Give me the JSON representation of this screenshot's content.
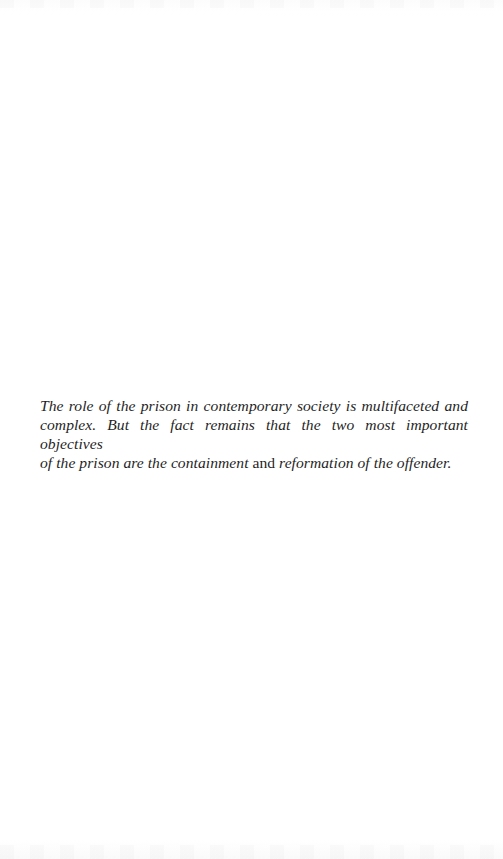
{
  "document": {
    "type": "book-page-epigraph",
    "epigraph": {
      "lines": [
        {
          "segments": [
            {
              "text": "The role of the prison in contemporary society is multifaceted and",
              "style": "italic"
            }
          ]
        },
        {
          "segments": [
            {
              "text": "complex. But the fact remains that the two most important objectives",
              "style": "italic"
            }
          ]
        },
        {
          "segments": [
            {
              "text": "of the prison are the containment",
              "style": "italic"
            },
            {
              "text": " and ",
              "style": "roman"
            },
            {
              "text": "reformation of the offender.",
              "style": "italic"
            }
          ]
        }
      ]
    }
  }
}
